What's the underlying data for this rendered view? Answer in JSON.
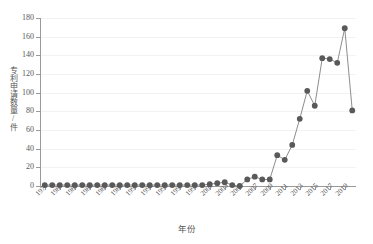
{
  "chart_data": {
    "type": "line",
    "title": "",
    "xlabel": "年份",
    "ylabel": "专利申请数量/件",
    "ylim": [
      0,
      180
    ],
    "ytick_step": 20,
    "yticks": [
      0,
      20,
      40,
      60,
      80,
      100,
      120,
      140,
      160,
      180
    ],
    "grid": true,
    "legend": "none",
    "marker": "filled-circle",
    "series_color": "#595959",
    "line_color": "#808080",
    "x": [
      1979,
      1980,
      1981,
      1982,
      1983,
      1984,
      1985,
      1986,
      1987,
      1988,
      1989,
      1990,
      1991,
      1992,
      1993,
      1994,
      1995,
      1996,
      1997,
      1998,
      1999,
      2000,
      2001,
      2002,
      2003,
      2004,
      2005,
      2006,
      2007,
      2008,
      2009,
      2010,
      2011,
      2012,
      2013,
      2014,
      2015,
      2016,
      2017,
      2018,
      2019,
      2020
    ],
    "values": [
      1,
      1,
      1,
      1,
      1,
      1,
      1,
      1,
      1,
      1,
      1,
      1,
      1,
      1,
      1,
      1,
      1,
      1,
      1,
      1,
      1,
      1,
      2,
      3,
      4,
      1,
      0,
      7,
      10,
      7,
      7,
      33,
      28,
      44,
      72,
      102,
      86,
      137,
      136,
      132,
      169,
      81
    ],
    "xticklabels": [
      "1979",
      "1981",
      "1983",
      "1985",
      "1987",
      "1989",
      "1991",
      "1993",
      "1995",
      "1997",
      "1999",
      "2001",
      "2003",
      "2005",
      "2007",
      "2009",
      "2011",
      "2013",
      "2015",
      "2017",
      "2019"
    ],
    "xtick_values": [
      1979,
      1981,
      1983,
      1985,
      1987,
      1989,
      1991,
      1993,
      1995,
      1997,
      1999,
      2001,
      2003,
      2005,
      2007,
      2009,
      2011,
      2013,
      2015,
      2017,
      2019
    ],
    "xlim": [
      1978.5,
      2020.5
    ]
  }
}
